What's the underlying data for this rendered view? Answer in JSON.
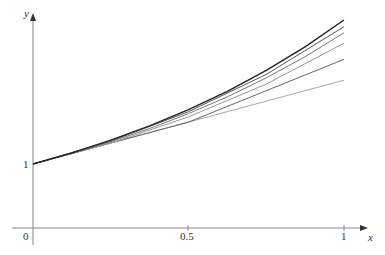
{
  "chart_data": {
    "type": "line",
    "title": "",
    "xlabel": "x",
    "ylabel": "y",
    "x_ticks": [
      "0",
      "0.5",
      "1"
    ],
    "y_ticks": [
      "1"
    ],
    "origin_label": "0",
    "xlim": [
      0,
      1
    ],
    "ylim": [
      0,
      2.75
    ],
    "grid": false,
    "legend": null,
    "series": [
      {
        "name": "exact",
        "x": [
          0,
          0.125,
          0.25,
          0.375,
          0.5,
          0.625,
          0.75,
          0.875,
          1
        ],
        "values": [
          1,
          1.133,
          1.284,
          1.455,
          1.649,
          1.868,
          2.117,
          2.399,
          2.718
        ],
        "color": "#222222"
      },
      {
        "name": "approx-16",
        "x": [
          0,
          0.25,
          0.5,
          0.75,
          1
        ],
        "values": [
          1,
          1.274,
          1.624,
          2.069,
          2.638
        ],
        "color": "#555555"
      },
      {
        "name": "approx-8",
        "x": [
          0,
          0.125,
          0.25,
          0.375,
          0.5,
          0.625,
          0.75,
          0.875,
          1
        ],
        "values": [
          1,
          1.125,
          1.266,
          1.424,
          1.602,
          1.802,
          2.027,
          2.281,
          2.566
        ],
        "color": "#777777"
      },
      {
        "name": "approx-4",
        "x": [
          0,
          0.25,
          0.5,
          0.75,
          1
        ],
        "values": [
          1,
          1.25,
          1.5625,
          1.953,
          2.441
        ],
        "color": "#999999"
      },
      {
        "name": "approx-2",
        "x": [
          0,
          0.5,
          1
        ],
        "values": [
          1,
          1.5,
          2.25
        ],
        "color": "#666666"
      },
      {
        "name": "approx-1",
        "x": [
          0,
          1
        ],
        "values": [
          1,
          2
        ],
        "color": "#aaaaaa"
      }
    ]
  },
  "axes": {
    "x_label": "x",
    "y_label": "y",
    "origin": "0",
    "tick_half": "0.5",
    "tick_one_x": "1",
    "tick_one_y": "1"
  }
}
